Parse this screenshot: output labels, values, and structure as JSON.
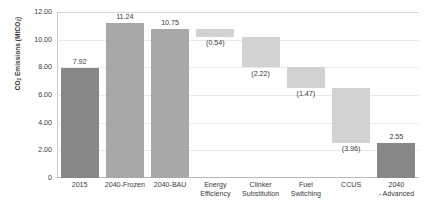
{
  "chart_data": {
    "type": "bar",
    "title": "",
    "xlabel": "",
    "ylabel": "CO2 Emissions (MtCO2)",
    "ylabel_main": "CO",
    "ylabel_sub1": "2",
    "ylabel_mid": " Emissions (MtCO",
    "ylabel_sub2": "2",
    "ylabel_end": ")",
    "ylim": [
      0,
      12
    ],
    "grid": true,
    "legend": "none",
    "yticks": [
      "0",
      "2.00",
      "4.00",
      "6.00",
      "8.00",
      "10.00",
      "12.00"
    ],
    "ytick_values": [
      0,
      2,
      4,
      6,
      8,
      10,
      12
    ],
    "categories": [
      "2015",
      "2040-Frozen",
      "2040-BAU",
      "Energy Efficiency",
      "Clinker Substitution",
      "Fuel Switching",
      "CCUS",
      "2040 - Advanced"
    ],
    "category_lines": [
      [
        "2015"
      ],
      [
        "2040-Frozen"
      ],
      [
        "2040-BAU"
      ],
      [
        "Energy",
        "Efficiency"
      ],
      [
        "Clinker",
        "Substitution"
      ],
      [
        "Fuel",
        "Switching"
      ],
      [
        "CCUS"
      ],
      [
        "2040",
        "- Advanced"
      ]
    ],
    "data_labels": [
      "7.92",
      "11.24",
      "10.75",
      "(0.54)",
      "(2.22)",
      "(1.47)",
      "(3.96)",
      "2.55"
    ],
    "values": [
      7.92,
      11.24,
      10.75,
      -0.54,
      -2.22,
      -1.47,
      -3.96,
      2.55
    ],
    "bars": [
      {
        "label": "2015",
        "value_label": "7.92",
        "base": 0,
        "top": 7.92,
        "kind": "total",
        "color": "#878787"
      },
      {
        "label": "2040-Frozen",
        "value_label": "11.24",
        "base": 0,
        "top": 11.24,
        "kind": "total",
        "color": "#a8a8a8"
      },
      {
        "label": "2040-BAU",
        "value_label": "10.75",
        "base": 0,
        "top": 10.75,
        "kind": "total",
        "color": "#a8a8a8"
      },
      {
        "label": "Energy Efficiency",
        "value_label": "(0.54)",
        "base": 10.21,
        "top": 10.75,
        "kind": "delta",
        "color": "#d2d2d2"
      },
      {
        "label": "Clinker Substitution",
        "value_label": "(2.22)",
        "base": 7.99,
        "top": 10.21,
        "kind": "delta",
        "color": "#d2d2d2"
      },
      {
        "label": "Fuel Switching",
        "value_label": "(1.47)",
        "base": 6.52,
        "top": 7.99,
        "kind": "delta",
        "color": "#d2d2d2"
      },
      {
        "label": "CCUS",
        "value_label": "(3.96)",
        "base": 2.56,
        "top": 6.52,
        "kind": "delta",
        "color": "#d2d2d2"
      },
      {
        "label": "2040 - Advanced",
        "value_label": "2.55",
        "base": 0,
        "top": 2.55,
        "kind": "total",
        "color": "#878787"
      }
    ]
  }
}
